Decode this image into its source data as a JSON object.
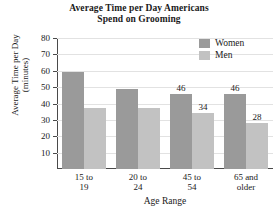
{
  "chart_data": {
    "type": "bar",
    "title": "Average Time per Day Americans Spend on Grooming",
    "title_line1": "Average Time per Day Americans",
    "title_line2": "Spend on Grooming",
    "xlabel": "Age Range",
    "ylabel": "Average Time per Day (minutes)",
    "ylabel_line1": "Average Time per Day",
    "ylabel_line2": "(minutes)",
    "categories": [
      "15 to 19",
      "20 to 24",
      "45 to 54",
      "65 and older"
    ],
    "category_lines": [
      [
        "15 to",
        "19"
      ],
      [
        "20 to",
        "24"
      ],
      [
        "45 to",
        "54"
      ],
      [
        "65 and",
        "older"
      ]
    ],
    "series": [
      {
        "name": "Women",
        "color": "#9a9a9a",
        "values": [
          59,
          49,
          46,
          46
        ],
        "labels": [
          "",
          "",
          "46",
          "46"
        ]
      },
      {
        "name": "Men",
        "color": "#c2c2c2",
        "values": [
          37,
          37,
          34,
          28
        ],
        "labels": [
          "",
          "",
          "34",
          "28"
        ]
      }
    ],
    "ylim": [
      0,
      80
    ],
    "yticks": [
      10,
      20,
      30,
      40,
      50,
      60,
      70,
      80
    ],
    "ytick_labels": [
      "10",
      "20",
      "30",
      "40",
      "50",
      "60",
      "70",
      "80"
    ],
    "grid": true,
    "legend_position": "top-right",
    "legend_entries": [
      "Women",
      "Men"
    ]
  }
}
